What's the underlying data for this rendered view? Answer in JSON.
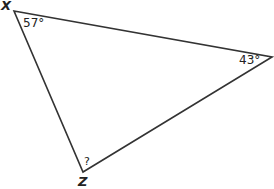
{
  "diagram": {
    "type": "triangle",
    "vertices": {
      "X": {
        "label": "X",
        "angle": "57°"
      },
      "Y": {
        "label": "",
        "angle": "43°"
      },
      "Z": {
        "label": "Z",
        "angle": "?"
      }
    },
    "colors": {
      "stroke": "#333333",
      "background": "#ffffff"
    }
  }
}
